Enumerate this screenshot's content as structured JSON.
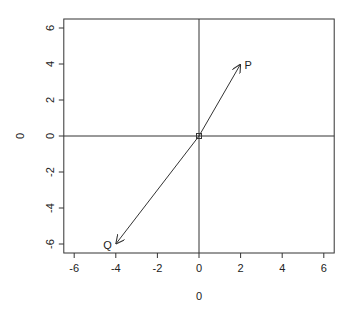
{
  "chart_data": {
    "type": "scatter",
    "title": "",
    "xlabel": "0",
    "ylabel": "0",
    "xlim": [
      -6.5,
      6.5
    ],
    "ylim": [
      -6.5,
      6.5
    ],
    "grid": false,
    "x_ticks": [
      -6,
      -4,
      -2,
      0,
      2,
      4,
      6
    ],
    "y_ticks": [
      -6,
      -4,
      -2,
      0,
      2,
      4,
      6
    ],
    "x_tick_labels": [
      "-6",
      "-4",
      "-2",
      "0",
      "2",
      "4",
      "6"
    ],
    "y_tick_labels": [
      "-6",
      "-4",
      "-2",
      "0",
      "2",
      "4",
      "6"
    ],
    "reference_lines": {
      "horizontal": 0,
      "vertical": 0
    },
    "origin_point": {
      "x": 0,
      "y": 0
    },
    "vectors": [
      {
        "label": "P",
        "from": [
          0,
          0
        ],
        "to": [
          2,
          4
        ]
      },
      {
        "label": "Q",
        "from": [
          0,
          0
        ],
        "to": [
          -4,
          -6
        ]
      }
    ]
  },
  "labels": {
    "x_axis": "0",
    "y_axis": "0",
    "vector_p": "P",
    "vector_q": "Q"
  }
}
